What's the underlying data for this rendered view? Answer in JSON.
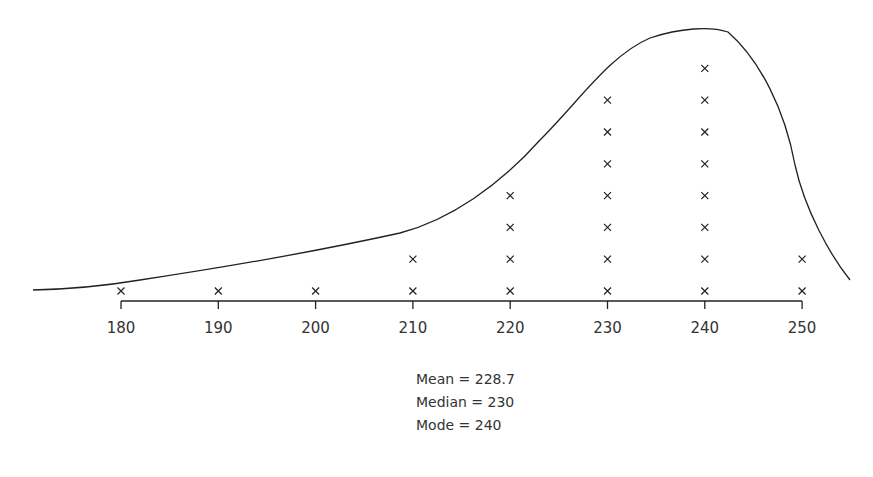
{
  "chart_data": {
    "type": "scatter",
    "subtype": "dot-plot-with-frequency-curve",
    "title": "",
    "xlabel": "",
    "ylabel": "",
    "x_ticks": [
      180,
      190,
      200,
      210,
      220,
      230,
      240,
      250
    ],
    "xlim": [
      171,
      255
    ],
    "grid": false,
    "marker": "x",
    "categories": [
      180,
      190,
      200,
      210,
      220,
      230,
      240,
      250
    ],
    "values": [
      1,
      1,
      1,
      2,
      4,
      7,
      8,
      2
    ],
    "curve": "smooth negatively-skewed frequency curve peaking near 241",
    "annotations": [
      "Mean = 228.7",
      "Median = 230",
      "Mode = 240"
    ]
  },
  "stats": {
    "mean": "Mean = 228.7",
    "median": "Median = 230",
    "mode": "Mode = 240"
  }
}
